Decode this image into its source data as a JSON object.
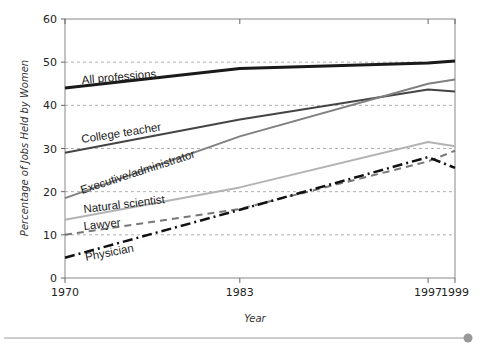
{
  "chart_data": {
    "type": "line",
    "title": "",
    "xlabel": "Year",
    "ylabel": "Percentage of Jobs Held by Women",
    "x": [
      1970,
      1983,
      1997,
      1999
    ],
    "x_tick_labels": [
      "1970",
      "1983",
      "1997",
      "1999"
    ],
    "y_tick_labels": [
      "0",
      "10",
      "20",
      "30",
      "40",
      "50",
      "60"
    ],
    "ylim": [
      0,
      60
    ],
    "xlim": [
      1970,
      1999
    ],
    "grid": "horizontal dashed",
    "legend_position": "inline labels",
    "series": [
      {
        "name": "All professions",
        "values": [
          44,
          48.5,
          49.8,
          50.3
        ],
        "color": "#1a1a1a",
        "dash": "solid",
        "width": 3
      },
      {
        "name": "College teacher",
        "values": [
          29,
          36.7,
          43.7,
          43.2
        ],
        "color": "#444444",
        "dash": "solid",
        "width": 2
      },
      {
        "name": "Executive/administrator",
        "values": [
          18.5,
          32.8,
          45,
          46
        ],
        "color": "#808080",
        "dash": "solid",
        "width": 2
      },
      {
        "name": "Natural scientist",
        "values": [
          13.5,
          21,
          31.5,
          30.5
        ],
        "color": "#b3b3b3",
        "dash": "solid",
        "width": 2
      },
      {
        "name": "Lawyer",
        "values": [
          10,
          16,
          27,
          29.5
        ],
        "color": "#777777",
        "dash": "7,5",
        "width": 2
      },
      {
        "name": "Physician",
        "values": [
          4.7,
          15.8,
          28,
          25.5
        ],
        "color": "#111111",
        "dash": "10,4,2,4",
        "width": 2.5
      }
    ]
  },
  "labels": {
    "xlabel": "Year",
    "ylabel": "Percentage of Jobs Held by Women"
  },
  "footer": {
    "accent_color": "#999999"
  }
}
